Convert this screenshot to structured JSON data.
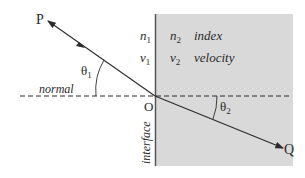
{
  "diagram": {
    "type": "refraction-at-interface",
    "colors": {
      "background": "#ffffff",
      "medium2": "#d9d9d9",
      "line": "#2a2a2a",
      "interface_line": "#555555"
    },
    "points": {
      "P": "P",
      "O": "O",
      "Q": "Q"
    },
    "labels": {
      "normal": "normal",
      "interface": "interface",
      "theta1_sym": "θ",
      "theta1_sub": "1",
      "theta2_sym": "θ",
      "theta2_sub": "2"
    },
    "medium1": {
      "n_sym": "n",
      "n_sub": "1",
      "v_sym": "v",
      "v_sub": "1"
    },
    "medium2": {
      "n_sym": "n",
      "n_sub": "2",
      "v_sym": "v",
      "v_sub": "2",
      "n_desc": "index",
      "v_desc": "velocity"
    }
  }
}
